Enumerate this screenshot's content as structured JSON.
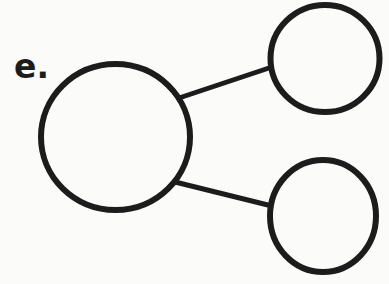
{
  "figure": {
    "label": "e.",
    "type": "node-link-diagram",
    "background": "#fbfbf9",
    "stroke_color": "#1c1c1c",
    "node_stroke_width": 6,
    "edge_stroke_width": 5,
    "nodes": [
      {
        "id": "large-circle",
        "cx": 115.5,
        "cy": 137,
        "rx": 74.5,
        "ry": 73
      },
      {
        "id": "top-right-circle",
        "cx": 325,
        "cy": 58.5,
        "rx": 54.5,
        "ry": 53.5
      },
      {
        "id": "bottom-right-circle",
        "cx": 323,
        "cy": 216,
        "rx": 53,
        "ry": 56
      }
    ],
    "edges": [
      {
        "from": "large-circle",
        "to": "top-right-circle",
        "x1": 170,
        "y1": 101,
        "x2": 281,
        "y2": 64
      },
      {
        "from": "large-circle",
        "to": "bottom-right-circle",
        "x1": 167,
        "y1": 180,
        "x2": 280,
        "y2": 208
      }
    ]
  }
}
